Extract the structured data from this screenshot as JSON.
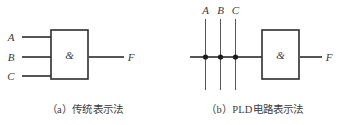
{
  "figure": {
    "panels": [
      {
        "id": "traditional",
        "caption": "（a）传统表示法",
        "gate": {
          "symbol": "&",
          "type": "AND"
        },
        "inputs": [
          {
            "label": "A"
          },
          {
            "label": "B"
          },
          {
            "label": "C"
          }
        ],
        "output": {
          "label": "F"
        }
      },
      {
        "id": "pld",
        "caption": "（b）PLD电路表示法",
        "gate": {
          "symbol": "&",
          "type": "AND"
        },
        "inputs": [
          {
            "label": "A"
          },
          {
            "label": "B"
          },
          {
            "label": "C"
          }
        ],
        "output": {
          "label": "F"
        },
        "connection_dots": 3
      }
    ],
    "colors": {
      "background": "#ffffff",
      "wire": "#555555",
      "gate_border": "#2e2e2e",
      "node": "#1c1c1c",
      "text": "#3a3a3a"
    }
  }
}
